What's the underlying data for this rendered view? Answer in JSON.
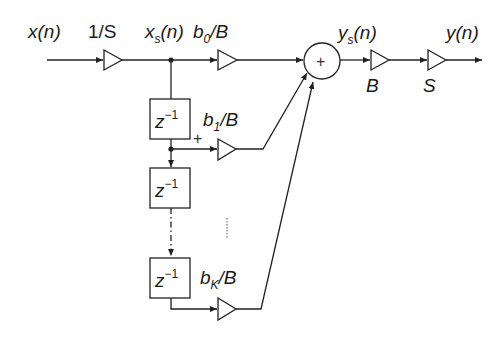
{
  "diagram": {
    "title": "",
    "type": "FIR filter with scaling (direct form, scaled by 1/S and 1/B)",
    "labels": {
      "input": "x(n)",
      "input_scale": "1/S",
      "scaled_input_main": "x",
      "scaled_input_sub": "s",
      "scaled_input_tail": "(n)",
      "coef0_main": "b",
      "coef0_sub": "0",
      "coef0_tail": "/B",
      "coef1_main": "b",
      "coef1_sub": "1",
      "coef1_tail": "/B",
      "coefk_main": "b",
      "coefk_sub": "K",
      "coefk_tail": "/B",
      "scaled_output_main": "y",
      "scaled_output_sub": "s",
      "scaled_output_tail": "(n)",
      "output": "y(n)",
      "gain_b": "B",
      "gain_s": "S",
      "delay_main": "z",
      "delay_sup": "−1",
      "summer_symbol": "+",
      "tap_sign": "+"
    },
    "nodes": [
      {
        "id": "amp-1-over-s",
        "kind": "gain",
        "label": "1/S"
      },
      {
        "id": "amp-b0",
        "kind": "gain",
        "label": "b0/B"
      },
      {
        "id": "delay-1",
        "kind": "delay",
        "label": "z^-1"
      },
      {
        "id": "amp-b1",
        "kind": "gain",
        "label": "b1/B"
      },
      {
        "id": "delay-2",
        "kind": "delay",
        "label": "z^-1"
      },
      {
        "id": "delay-k",
        "kind": "delay",
        "label": "z^-1"
      },
      {
        "id": "amp-bk",
        "kind": "gain",
        "label": "bK/B"
      },
      {
        "id": "summer",
        "kind": "sum",
        "label": "+"
      },
      {
        "id": "amp-B",
        "kind": "gain",
        "label": "B"
      },
      {
        "id": "amp-S",
        "kind": "gain",
        "label": "S"
      }
    ],
    "edges": [
      [
        "x(n)",
        "amp-1-over-s"
      ],
      [
        "amp-1-over-s",
        "xs(n)"
      ],
      [
        "xs(n)",
        "amp-b0"
      ],
      [
        "xs(n)",
        "delay-1"
      ],
      [
        "delay-1",
        "amp-b1"
      ],
      [
        "delay-1",
        "delay-2"
      ],
      [
        "delay-2",
        "delay-k"
      ],
      [
        "delay-k",
        "amp-bk"
      ],
      [
        "amp-b0",
        "summer"
      ],
      [
        "amp-b1",
        "summer"
      ],
      [
        "amp-bk",
        "summer"
      ],
      [
        "summer",
        "amp-B"
      ],
      [
        "amp-B",
        "amp-S"
      ],
      [
        "amp-S",
        "y(n)"
      ]
    ]
  }
}
